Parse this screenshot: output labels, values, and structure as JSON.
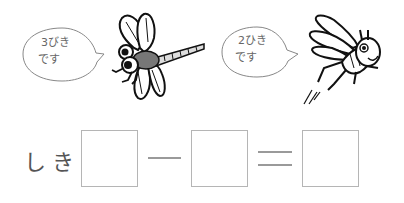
{
  "bubbles": [
    {
      "line1": "3びき",
      "line2": "です"
    },
    {
      "line1": "2ひき",
      "line2": "です"
    }
  ],
  "illustrations": {
    "left": "dragonfly",
    "right": "grasshopper"
  },
  "equation": {
    "label": "しき",
    "operator": "−",
    "equals": "=",
    "boxes": [
      "",
      "",
      ""
    ]
  }
}
